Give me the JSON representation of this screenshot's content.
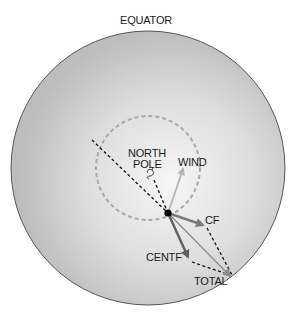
{
  "diagram": {
    "labels": {
      "equator": "EQUATOR",
      "north": "NORTH",
      "pole": "POLE",
      "wind": "WIND",
      "cf": "CF",
      "centf": "CENTF",
      "total": "TOTAL"
    },
    "colors": {
      "disk_edge": "#bcbcbc",
      "disk_center": "#f4f4f4",
      "outline": "#555555",
      "dashed_circle": "#a8a8a8",
      "wind_arrow": "#b4b4b4",
      "cf_arrow": "#7a7a7a",
      "centf_arrow": "#5f5f5f",
      "total_arrow": "#8c8c8c",
      "dashed_line": "#111111",
      "dot": "#000000"
    },
    "icons": {
      "pole_marker": "swirl-icon"
    }
  }
}
